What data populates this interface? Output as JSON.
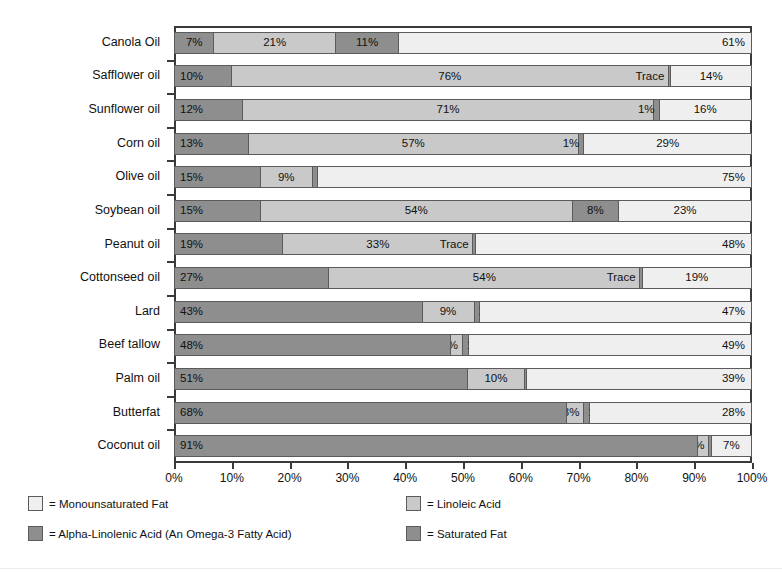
{
  "chart_data": {
    "type": "bar",
    "orientation": "horizontal",
    "stacked": true,
    "title": "",
    "xlabel": "",
    "ylabel": "Dietary Fat",
    "xlim": [
      0,
      100
    ],
    "grid": false,
    "legend_position": "bottom",
    "xtick_labels": [
      "0%",
      "10%",
      "20%",
      "30%",
      "40%",
      "50%",
      "60%",
      "70%",
      "80%",
      "90%",
      "100%"
    ],
    "xtick_values": [
      0,
      10,
      20,
      30,
      40,
      50,
      60,
      70,
      80,
      90,
      100
    ],
    "series": [
      {
        "name": "Saturated Fat",
        "key": "saturated",
        "color": "#8e8e8e",
        "values": [
          7,
          10,
          12,
          13,
          15,
          15,
          19,
          27,
          43,
          48,
          51,
          68,
          91
        ]
      },
      {
        "name": "Linoleic Acid",
        "key": "linoleic",
        "color": "#c9c9c9",
        "values": [
          21,
          76,
          71,
          57,
          9,
          54,
          33,
          54,
          9,
          2,
          10,
          3,
          2
        ]
      },
      {
        "name": "Alpha-Linolenic Acid (An Omega-3 Fatty Acid)",
        "key": "alpha_linolenic",
        "color": "#8e8e8e",
        "values": [
          11,
          0.4,
          1,
          1,
          1,
          8,
          0.4,
          0.4,
          1,
          1,
          0.4,
          1,
          0.4
        ]
      },
      {
        "name": "Monounsaturated Fat",
        "key": "monounsaturated",
        "color": "#efefef",
        "values": [
          61,
          14,
          16,
          29,
          75,
          23,
          48,
          19,
          47,
          49,
          39,
          28,
          7
        ]
      }
    ],
    "categories": [
      "Canola Oil",
      "Safflower oil",
      "Sunflower oil",
      "Corn oil",
      "Olive oil",
      "Soybean oil",
      "Peanut oil",
      "Cottonseed oil",
      "Lard",
      "Beef tallow",
      "Palm oil",
      "Butterfat",
      "Coconut oil"
    ],
    "rows": [
      {
        "category": "Canola Oil",
        "segments": [
          {
            "key": "saturated",
            "value": 7,
            "label": "7%",
            "align": "center"
          },
          {
            "key": "linoleic",
            "value": 21,
            "label": "21%",
            "align": "center"
          },
          {
            "key": "alpha_linolenic",
            "value": 11,
            "label": "11%",
            "align": "center"
          },
          {
            "key": "monounsaturated",
            "value": 61,
            "label": "61%",
            "align": "right"
          }
        ]
      },
      {
        "category": "Safflower oil",
        "segments": [
          {
            "key": "saturated",
            "value": 10,
            "label": "10%",
            "align": "left"
          },
          {
            "key": "linoleic",
            "value": 76,
            "label": "76%",
            "align": "center"
          },
          {
            "key": "alpha_linolenic",
            "value": 0.4,
            "label": "Trace",
            "align": "trace"
          },
          {
            "key": "monounsaturated",
            "value": 14,
            "label": "14%",
            "align": "center"
          }
        ]
      },
      {
        "category": "Sunflower oil",
        "segments": [
          {
            "key": "saturated",
            "value": 12,
            "label": "12%",
            "align": "left"
          },
          {
            "key": "linoleic",
            "value": 71,
            "label": "71%",
            "align": "center"
          },
          {
            "key": "alpha_linolenic",
            "value": 1,
            "label": "1%",
            "align": "rightout"
          },
          {
            "key": "monounsaturated",
            "value": 16,
            "label": "16%",
            "align": "center"
          }
        ]
      },
      {
        "category": "Corn oil",
        "segments": [
          {
            "key": "saturated",
            "value": 13,
            "label": "13%",
            "align": "left"
          },
          {
            "key": "linoleic",
            "value": 57,
            "label": "57%",
            "align": "center"
          },
          {
            "key": "alpha_linolenic",
            "value": 1,
            "label": "1%",
            "align": "rightout"
          },
          {
            "key": "monounsaturated",
            "value": 29,
            "label": "29%",
            "align": "center"
          }
        ]
      },
      {
        "category": "Olive oil",
        "segments": [
          {
            "key": "saturated",
            "value": 15,
            "label": "15%",
            "align": "left"
          },
          {
            "key": "linoleic",
            "value": 9,
            "label": "9%",
            "align": "center"
          },
          {
            "key": "alpha_linolenic",
            "value": 1,
            "label": "1%",
            "align": "leftout"
          },
          {
            "key": "monounsaturated",
            "value": 75,
            "label": "75%",
            "align": "right"
          }
        ]
      },
      {
        "category": "Soybean oil",
        "segments": [
          {
            "key": "saturated",
            "value": 15,
            "label": "15%",
            "align": "left"
          },
          {
            "key": "linoleic",
            "value": 54,
            "label": "54%",
            "align": "center"
          },
          {
            "key": "alpha_linolenic",
            "value": 8,
            "label": "8%",
            "align": "center"
          },
          {
            "key": "monounsaturated",
            "value": 23,
            "label": "23%",
            "align": "center"
          }
        ]
      },
      {
        "category": "Peanut oil",
        "segments": [
          {
            "key": "saturated",
            "value": 19,
            "label": "19%",
            "align": "left"
          },
          {
            "key": "linoleic",
            "value": 33,
            "label": "33%",
            "align": "center"
          },
          {
            "key": "alpha_linolenic",
            "value": 0.4,
            "label": "Trace",
            "align": "trace"
          },
          {
            "key": "monounsaturated",
            "value": 48,
            "label": "48%",
            "align": "right"
          }
        ]
      },
      {
        "category": "Cottonseed oil",
        "segments": [
          {
            "key": "saturated",
            "value": 27,
            "label": "27%",
            "align": "left"
          },
          {
            "key": "linoleic",
            "value": 54,
            "label": "54%",
            "align": "center"
          },
          {
            "key": "alpha_linolenic",
            "value": 0.4,
            "label": "Trace",
            "align": "trace"
          },
          {
            "key": "monounsaturated",
            "value": 19,
            "label": "19%",
            "align": "center"
          }
        ]
      },
      {
        "category": "Lard",
        "segments": [
          {
            "key": "saturated",
            "value": 43,
            "label": "43%",
            "align": "left"
          },
          {
            "key": "linoleic",
            "value": 9,
            "label": "9%",
            "align": "center"
          },
          {
            "key": "alpha_linolenic",
            "value": 1,
            "label": "1%",
            "align": "leftout"
          },
          {
            "key": "monounsaturated",
            "value": 47,
            "label": "47%",
            "align": "right"
          }
        ]
      },
      {
        "category": "Beef tallow",
        "segments": [
          {
            "key": "saturated",
            "value": 48,
            "label": "48%",
            "align": "left"
          },
          {
            "key": "linoleic",
            "value": 2,
            "label": "2%",
            "align": "leftoutpre"
          },
          {
            "key": "alpha_linolenic",
            "value": 1,
            "label": "1%",
            "align": "leftout"
          },
          {
            "key": "monounsaturated",
            "value": 49,
            "label": "49%",
            "align": "right"
          }
        ]
      },
      {
        "category": "Palm oil",
        "segments": [
          {
            "key": "saturated",
            "value": 51,
            "label": "51%",
            "align": "left"
          },
          {
            "key": "linoleic",
            "value": 10,
            "label": "10%",
            "align": "center"
          },
          {
            "key": "alpha_linolenic",
            "value": 0.4,
            "label": "Trace",
            "align": "traceleft"
          },
          {
            "key": "monounsaturated",
            "value": 39,
            "label": "39%",
            "align": "right"
          }
        ]
      },
      {
        "category": "Butterfat",
        "segments": [
          {
            "key": "saturated",
            "value": 68,
            "label": "68%",
            "align": "left"
          },
          {
            "key": "linoleic",
            "value": 3,
            "label": "3%",
            "align": "leftoutpre"
          },
          {
            "key": "alpha_linolenic",
            "value": 1,
            "label": "1%",
            "align": "leftout"
          },
          {
            "key": "monounsaturated",
            "value": 28,
            "label": "28%",
            "align": "right"
          }
        ]
      },
      {
        "category": "Coconut oil",
        "segments": [
          {
            "key": "saturated",
            "value": 91,
            "label": "91%",
            "align": "left"
          },
          {
            "key": "linoleic",
            "value": 2,
            "label": "2%",
            "align": "leftoutpre"
          },
          {
            "key": "alpha_linolenic",
            "value": 0.4,
            "label": "",
            "align": "none"
          },
          {
            "key": "monounsaturated",
            "value": 7,
            "label": "7%",
            "align": "center"
          }
        ]
      }
    ],
    "legend": [
      {
        "label": "= Monounsaturated Fat",
        "color": "#efefef",
        "col": 0,
        "row": 0
      },
      {
        "label": "= Linoleic Acid",
        "color": "#c9c9c9",
        "col": 1,
        "row": 0
      },
      {
        "label": "= Alpha-Linolenic Acid (An Omega-3 Fatty Acid)",
        "color": "#8e8e8e",
        "col": 0,
        "row": 1
      },
      {
        "label": "= Saturated Fat",
        "color": "#8e8e8e",
        "col": 1,
        "row": 1
      }
    ]
  }
}
